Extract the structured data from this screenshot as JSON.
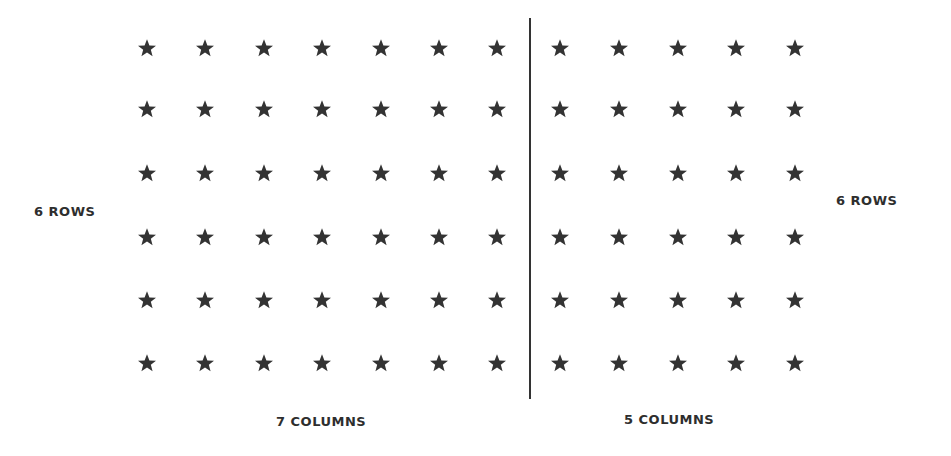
{
  "diagram": {
    "left_group": {
      "rows_label": "6 ROWS",
      "columns_label": "7 COLUMNS",
      "rows": 6,
      "columns": 7
    },
    "right_group": {
      "rows_label": "6 ROWS",
      "columns_label": "5 COLUMNS",
      "rows": 6,
      "columns": 5
    },
    "icon": "star-icon",
    "star_color": "#333333",
    "divider_color": "#333333"
  }
}
